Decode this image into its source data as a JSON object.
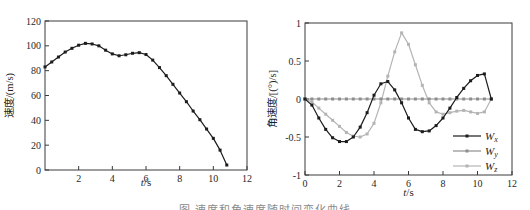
{
  "figure": {
    "caption": "图 速度和角速度随时间变化曲线",
    "background": "#ffffff",
    "axis_color": "#3a3a3a",
    "tick_text_color": "#1f1f1f"
  },
  "chart_data": [
    {
      "id": "velocity",
      "type": "line",
      "title": "",
      "xlabel": "t/s",
      "xlabel_italic_var": true,
      "ylabel": "速度/(m/s)",
      "xlim": [
        0,
        12
      ],
      "ylim": [
        0,
        120
      ],
      "xticks": [
        2,
        4,
        6,
        8,
        10,
        12
      ],
      "yticks": [
        0,
        20,
        40,
        60,
        80,
        100,
        120
      ],
      "grid": false,
      "legend": null,
      "box": {
        "x0": 45,
        "y0": 21,
        "x1": 247,
        "y1": 170,
        "xlabel_y": 186,
        "ylabel_x": 13
      },
      "x": [
        0,
        0.4,
        0.8,
        1.2,
        1.6,
        2.0,
        2.4,
        2.8,
        3.2,
        3.6,
        4.0,
        4.4,
        4.8,
        5.2,
        5.6,
        6.0,
        6.4,
        6.8,
        7.2,
        7.6,
        8.0,
        8.4,
        8.8,
        9.2,
        9.6,
        10.0,
        10.4,
        10.8
      ],
      "series": [
        {
          "name": "velocity",
          "color": "#1c1c1c",
          "marker": "square",
          "values": [
            83,
            87,
            91,
            95,
            98,
            100.5,
            102,
            101.5,
            100,
            96.5,
            93.5,
            92,
            92.8,
            94,
            94.5,
            93,
            88.5,
            82.5,
            76,
            69,
            62,
            55,
            47.5,
            40.5,
            33,
            25.5,
            16,
            4
          ]
        }
      ]
    },
    {
      "id": "angular-velocity",
      "type": "line",
      "title": "",
      "xlabel": "t/s",
      "xlabel_italic_var": true,
      "ylabel": "角速度/[(°)/s]",
      "xlim": [
        0,
        12
      ],
      "ylim": [
        -1,
        1
      ],
      "xticks": [
        0,
        2,
        4,
        6,
        8,
        10,
        12
      ],
      "yticks": [
        -1,
        -0.5,
        0,
        0.5,
        1
      ],
      "grid": false,
      "legend": {
        "position": "inside-right-bottom",
        "x": 188,
        "y": 136,
        "row_height": 15,
        "entries": [
          {
            "text": "W",
            "sub": "x"
          },
          {
            "text": "W",
            "sub": "y"
          },
          {
            "text": "W",
            "sub": "z"
          }
        ]
      },
      "box": {
        "x0": 40,
        "y0": 23,
        "x1": 247,
        "y1": 175,
        "xlabel_y": 196,
        "ylabel_x": 11
      },
      "x": [
        0,
        0.4,
        0.8,
        1.2,
        1.6,
        2.0,
        2.4,
        2.8,
        3.2,
        3.6,
        4.0,
        4.4,
        4.8,
        5.2,
        5.6,
        6.0,
        6.4,
        6.8,
        7.2,
        7.6,
        8.0,
        8.4,
        8.8,
        9.2,
        9.6,
        10.0,
        10.4,
        10.8
      ],
      "series": [
        {
          "name": "Wx",
          "color": "#1c1c1c",
          "marker": "square",
          "values": [
            0,
            -0.08,
            -0.25,
            -0.4,
            -0.51,
            -0.56,
            -0.56,
            -0.5,
            -0.37,
            -0.18,
            0.05,
            0.2,
            0.23,
            0.12,
            -0.05,
            -0.25,
            -0.4,
            -0.43,
            -0.42,
            -0.35,
            -0.25,
            -0.12,
            0.02,
            0.14,
            0.24,
            0.31,
            0.33,
            0
          ],
          "draw_order": 3
        },
        {
          "name": "Wy",
          "color": "#8e8e8e",
          "marker": "square",
          "values": [
            0,
            0,
            0,
            0,
            0,
            0,
            0,
            0,
            0,
            0,
            0,
            0,
            0,
            0,
            0,
            0,
            0,
            0,
            0,
            0,
            0,
            0,
            0,
            0,
            0,
            0,
            0,
            0
          ],
          "draw_order": 2
        },
        {
          "name": "Wz",
          "color": "#b4b4b4",
          "marker": "square",
          "values": [
            0,
            -0.04,
            -0.12,
            -0.2,
            -0.28,
            -0.36,
            -0.44,
            -0.49,
            -0.5,
            -0.46,
            -0.32,
            -0.05,
            0.3,
            0.62,
            0.87,
            0.72,
            0.45,
            0.18,
            -0.05,
            -0.17,
            -0.2,
            -0.18,
            -0.16,
            -0.15,
            -0.17,
            -0.19,
            -0.17,
            0
          ],
          "draw_order": 1
        }
      ]
    }
  ]
}
